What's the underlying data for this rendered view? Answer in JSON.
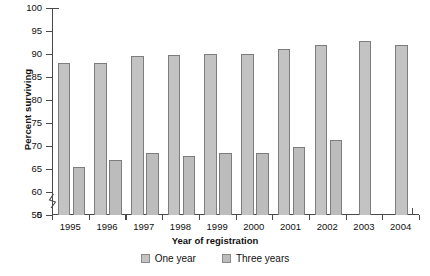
{
  "chart_data": {
    "type": "bar",
    "title": "",
    "xlabel": "Year of registration",
    "ylabel": "Percent surviving",
    "categories": [
      "1995",
      "1996",
      "1997",
      "1998",
      "1999",
      "2000",
      "2001",
      "2002",
      "2003",
      "2004"
    ],
    "series": [
      {
        "name": "One year",
        "color": "#c3c3c3",
        "values": [
          88.0,
          88.1,
          89.5,
          89.8,
          90.0,
          90.1,
          91.0,
          92.0,
          92.8,
          92.0
        ]
      },
      {
        "name": "Three years",
        "color": "#bcbcbc",
        "values": [
          65.5,
          66.9,
          68.4,
          67.8,
          68.4,
          68.4,
          69.8,
          71.2,
          null,
          null
        ]
      }
    ],
    "ylim": [
      55,
      100
    ],
    "yticks": [
      "0",
      "55",
      "60",
      "65",
      "70",
      "75",
      "80",
      "85",
      "90",
      "95",
      "100"
    ],
    "axis_break": true,
    "axis_break_label": "0",
    "grid": false,
    "legend_position": "bottom"
  },
  "legend": {
    "entries": [
      {
        "label": "One year"
      },
      {
        "label": "Three years"
      }
    ]
  },
  "axes": {
    "y_title": "Percent surviving",
    "x_title": "Year of registration"
  },
  "colors": {
    "bar_one_year": "#c3c3c3",
    "bar_three_years": "#bcbcbc",
    "bar_border": "#7d7d7d",
    "axis": "#4a4a4a",
    "text": "#111111",
    "background": "#ffffff"
  }
}
